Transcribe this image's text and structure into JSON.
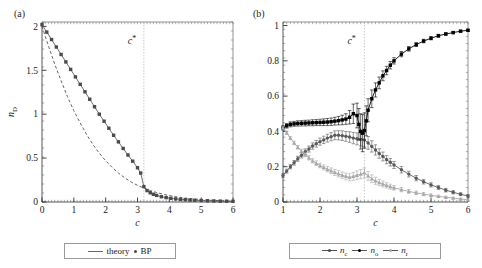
{
  "figure": {
    "width": 482,
    "height": 268,
    "background": "#ffffff",
    "panels": [
      "a",
      "b"
    ]
  },
  "panel_a": {
    "label": "(a)",
    "annotation": {
      "text": "c",
      "superscript": "*",
      "at_x": 3.2
    },
    "legend": {
      "items": [
        {
          "label": "theory",
          "marker": "line",
          "color": "#666666"
        },
        {
          "label": "BP",
          "marker": "dot",
          "color": "#4a4a4a"
        }
      ]
    }
  },
  "panel_b": {
    "label": "(b)",
    "annotation": {
      "text": "c",
      "superscript": "*",
      "at_x": 3.2
    },
    "legend": {
      "items": [
        {
          "label": "n",
          "sub": "c",
          "marker": "line-dot",
          "color": "#5a5a5a"
        },
        {
          "label": "n",
          "sub": "o",
          "marker": "line-dot",
          "color": "#000000"
        },
        {
          "label": "n",
          "sub": "r",
          "marker": "line-tri",
          "color": "#a8a8a8"
        }
      ]
    }
  },
  "chart_data": [
    {
      "type": "line",
      "panel": "a",
      "title": "",
      "xlabel": "c",
      "ylabel": "n_D",
      "ylabel_base": "n",
      "ylabel_sub": "D",
      "xlim": [
        0,
        6
      ],
      "ylim": [
        0,
        2.05
      ],
      "xticks": [
        0,
        1,
        2,
        3,
        4,
        5,
        6
      ],
      "xticklabels": [
        "0",
        "1",
        "2",
        "3",
        "4",
        "5",
        "6"
      ],
      "yticks": [
        0,
        0.5,
        1,
        1.5,
        2
      ],
      "yticklabels": [
        "0",
        "0.5",
        "1",
        "1.5",
        "2"
      ],
      "grid": false,
      "vline": {
        "x": 3.2,
        "style": "dotted",
        "color": "#bbbbbb"
      },
      "series": [
        {
          "name": "theory",
          "style": "dashed",
          "color": "#555555",
          "x": [
            0,
            0.2,
            0.4,
            0.6,
            0.8,
            1.0,
            1.2,
            1.4,
            1.6,
            1.8,
            2.0,
            2.2,
            2.4,
            2.6,
            2.8,
            3.0,
            3.2,
            3.4,
            3.6,
            3.8,
            4.0,
            4.4,
            4.8,
            5.2,
            5.6,
            6.0
          ],
          "y": [
            2.0,
            1.78,
            1.57,
            1.38,
            1.2,
            1.04,
            0.9,
            0.77,
            0.655,
            0.555,
            0.47,
            0.395,
            0.33,
            0.275,
            0.228,
            0.19,
            0.158,
            0.131,
            0.108,
            0.089,
            0.073,
            0.049,
            0.033,
            0.022,
            0.014,
            0.009
          ]
        },
        {
          "name": "BP",
          "style": "markers-line",
          "color": "#4a4a4a",
          "x": [
            0,
            0.15,
            0.3,
            0.45,
            0.6,
            0.75,
            0.9,
            1.05,
            1.2,
            1.35,
            1.5,
            1.65,
            1.8,
            1.95,
            2.1,
            2.25,
            2.4,
            2.55,
            2.7,
            2.85,
            3.0,
            3.1,
            3.2,
            3.3,
            3.4,
            3.5,
            3.6,
            3.75,
            3.9,
            4.05,
            4.2,
            4.35,
            4.5,
            4.65,
            4.8,
            5.0,
            5.2,
            5.4,
            5.6,
            5.8,
            6.0
          ],
          "y": [
            2.02,
            1.935,
            1.85,
            1.765,
            1.68,
            1.595,
            1.51,
            1.425,
            1.34,
            1.255,
            1.17,
            1.085,
            1.0,
            0.92,
            0.84,
            0.76,
            0.685,
            0.61,
            0.535,
            0.465,
            0.39,
            0.33,
            0.175,
            0.13,
            0.105,
            0.088,
            0.075,
            0.06,
            0.05,
            0.042,
            0.035,
            0.03,
            0.026,
            0.023,
            0.02,
            0.017,
            0.014,
            0.012,
            0.01,
            0.009,
            0.008
          ]
        }
      ]
    },
    {
      "type": "line",
      "panel": "b",
      "title": "",
      "xlabel": "c",
      "ylabel": "",
      "xlim": [
        1,
        6
      ],
      "ylim": [
        0,
        1.02
      ],
      "xticks": [
        1,
        2,
        3,
        4,
        5,
        6
      ],
      "xticklabels": [
        "1",
        "2",
        "3",
        "4",
        "5",
        "6"
      ],
      "yticks": [
        0,
        0.2,
        0.4,
        0.6,
        0.8,
        1
      ],
      "yticklabels": [
        "0",
        "0.2",
        "0.4",
        "0.6",
        "0.8",
        "1"
      ],
      "grid": false,
      "errorbars": true,
      "vline": {
        "x": 3.2,
        "style": "dotted",
        "color": "#bbbbbb"
      },
      "series": [
        {
          "name": "n_c",
          "label_base": "n",
          "label_sub": "c",
          "color": "#5a5a5a",
          "marker": "circle",
          "x": [
            1.0,
            1.1,
            1.2,
            1.3,
            1.4,
            1.5,
            1.6,
            1.7,
            1.8,
            1.9,
            2.0,
            2.1,
            2.2,
            2.3,
            2.4,
            2.5,
            2.6,
            2.7,
            2.8,
            2.9,
            3.0,
            3.1,
            3.2,
            3.3,
            3.4,
            3.5,
            3.6,
            3.7,
            3.8,
            3.9,
            4.0,
            4.2,
            4.4,
            4.6,
            4.8,
            5.0,
            5.2,
            5.4,
            5.6,
            5.8,
            6.0
          ],
          "y": [
            0.15,
            0.175,
            0.2,
            0.222,
            0.245,
            0.265,
            0.285,
            0.3,
            0.317,
            0.33,
            0.342,
            0.352,
            0.362,
            0.37,
            0.378,
            0.378,
            0.376,
            0.372,
            0.368,
            0.362,
            0.358,
            0.355,
            0.352,
            0.335,
            0.315,
            0.295,
            0.275,
            0.258,
            0.24,
            0.225,
            0.21,
            0.183,
            0.158,
            0.135,
            0.115,
            0.097,
            0.082,
            0.067,
            0.055,
            0.044,
            0.034
          ],
          "yerr": [
            0.01,
            0.011,
            0.012,
            0.013,
            0.014,
            0.015,
            0.016,
            0.017,
            0.018,
            0.019,
            0.02,
            0.021,
            0.022,
            0.023,
            0.025,
            0.026,
            0.027,
            0.028,
            0.03,
            0.032,
            0.034,
            0.038,
            0.04,
            0.036,
            0.032,
            0.029,
            0.027,
            0.025,
            0.023,
            0.021,
            0.02,
            0.018,
            0.016,
            0.015,
            0.013,
            0.012,
            0.011,
            0.01,
            0.009,
            0.008,
            0.007
          ]
        },
        {
          "name": "n_o",
          "label_base": "n",
          "label_sub": "o",
          "color": "#000000",
          "marker": "square",
          "x": [
            1.0,
            1.1,
            1.2,
            1.3,
            1.4,
            1.5,
            1.6,
            1.7,
            1.8,
            1.9,
            2.0,
            2.1,
            2.2,
            2.3,
            2.4,
            2.5,
            2.6,
            2.7,
            2.8,
            2.9,
            3.0,
            3.05,
            3.1,
            3.15,
            3.2,
            3.25,
            3.3,
            3.4,
            3.5,
            3.6,
            3.7,
            3.8,
            3.9,
            4.0,
            4.2,
            4.4,
            4.6,
            4.8,
            5.0,
            5.2,
            5.4,
            5.6,
            5.8,
            6.0
          ],
          "y": [
            0.42,
            0.432,
            0.44,
            0.443,
            0.445,
            0.446,
            0.447,
            0.448,
            0.449,
            0.45,
            0.451,
            0.452,
            0.453,
            0.455,
            0.458,
            0.461,
            0.465,
            0.47,
            0.48,
            0.5,
            0.49,
            0.44,
            0.4,
            0.39,
            0.405,
            0.46,
            0.52,
            0.585,
            0.635,
            0.675,
            0.715,
            0.745,
            0.775,
            0.8,
            0.838,
            0.868,
            0.892,
            0.912,
            0.928,
            0.942,
            0.952,
            0.96,
            0.968,
            0.973
          ],
          "yerr": [
            0.012,
            0.013,
            0.014,
            0.014,
            0.015,
            0.015,
            0.016,
            0.016,
            0.017,
            0.017,
            0.018,
            0.019,
            0.02,
            0.021,
            0.022,
            0.024,
            0.027,
            0.03,
            0.038,
            0.055,
            0.07,
            0.09,
            0.1,
            0.105,
            0.1,
            0.085,
            0.065,
            0.05,
            0.04,
            0.033,
            0.028,
            0.024,
            0.021,
            0.018,
            0.015,
            0.013,
            0.011,
            0.01,
            0.009,
            0.008,
            0.007,
            0.006,
            0.005,
            0.005
          ]
        },
        {
          "name": "n_r",
          "label_base": "n",
          "label_sub": "r",
          "color": "#a8a8a8",
          "marker": "triangle",
          "x": [
            1.0,
            1.1,
            1.2,
            1.3,
            1.4,
            1.5,
            1.6,
            1.7,
            1.8,
            1.9,
            2.0,
            2.1,
            2.2,
            2.3,
            2.4,
            2.5,
            2.6,
            2.7,
            2.8,
            2.9,
            3.0,
            3.1,
            3.2,
            3.3,
            3.4,
            3.5,
            3.6,
            3.7,
            3.8,
            3.9,
            4.0,
            4.2,
            4.4,
            4.6,
            4.8,
            5.0,
            5.2,
            5.4,
            5.6,
            5.8,
            6.0
          ],
          "y": [
            0.42,
            0.392,
            0.362,
            0.335,
            0.31,
            0.288,
            0.268,
            0.25,
            0.233,
            0.22,
            0.207,
            0.196,
            0.186,
            0.177,
            0.168,
            0.16,
            0.152,
            0.145,
            0.14,
            0.145,
            0.152,
            0.158,
            0.165,
            0.148,
            0.132,
            0.12,
            0.11,
            0.102,
            0.094,
            0.087,
            0.08,
            0.07,
            0.06,
            0.052,
            0.045,
            0.038,
            0.032,
            0.027,
            0.022,
            0.017,
            0.013
          ],
          "yerr": [
            0.008,
            0.009,
            0.009,
            0.01,
            0.01,
            0.011,
            0.011,
            0.012,
            0.012,
            0.013,
            0.013,
            0.014,
            0.015,
            0.016,
            0.017,
            0.018,
            0.018,
            0.019,
            0.02,
            0.022,
            0.024,
            0.026,
            0.028,
            0.025,
            0.022,
            0.02,
            0.018,
            0.017,
            0.015,
            0.014,
            0.013,
            0.012,
            0.011,
            0.01,
            0.009,
            0.008,
            0.007,
            0.006,
            0.005,
            0.005,
            0.004
          ]
        }
      ]
    }
  ]
}
